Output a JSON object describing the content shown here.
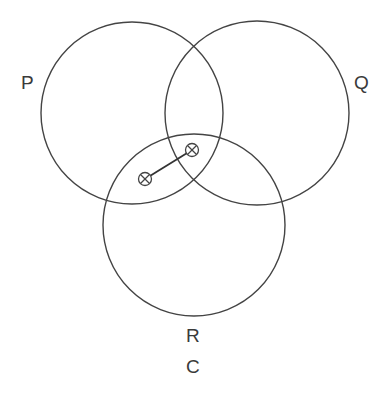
{
  "diagram": {
    "type": "venn",
    "stroke_color": "#444444",
    "circles": [
      {
        "label": "P",
        "cx": 132,
        "cy": 113,
        "r": 91
      },
      {
        "label": "Q",
        "cx": 257,
        "cy": 113,
        "r": 92
      },
      {
        "label": "R",
        "cx": 194,
        "cy": 225,
        "r": 91
      }
    ],
    "labels": {
      "p": "P",
      "q": "Q",
      "r": "R",
      "caption": "C"
    },
    "markers": [
      {
        "symbol": "circled-x",
        "x": 145,
        "y": 179
      },
      {
        "symbol": "circled-x",
        "x": 192,
        "y": 150
      }
    ],
    "connector": {
      "from": 0,
      "to": 1
    }
  }
}
